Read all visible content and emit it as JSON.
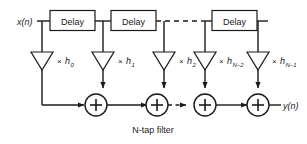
{
  "figure": {
    "caption": "N-tap filter",
    "background_color": "#ffffff",
    "line_color": "#1a1a1a"
  },
  "signals": {
    "input_label": "x(n)",
    "output_label": "y(n)"
  },
  "delays": [
    {
      "label": "Delay"
    },
    {
      "label": "Delay"
    },
    {
      "label": "Delay"
    }
  ],
  "taps": [
    {
      "multiplier_symbol": "×",
      "coefficient": "h",
      "subscript": "0"
    },
    {
      "multiplier_symbol": "×",
      "coefficient": "h",
      "subscript": "1"
    },
    {
      "multiplier_symbol": "×",
      "coefficient": "h",
      "subscript": "2"
    },
    {
      "multiplier_symbol": "×",
      "coefficient": "h",
      "subscript": "N−2"
    },
    {
      "multiplier_symbol": "×",
      "coefficient": "h",
      "subscript": "N−1"
    }
  ],
  "adders": [
    {
      "symbol": "+"
    },
    {
      "symbol": "+"
    },
    {
      "symbol": "+"
    },
    {
      "symbol": "+"
    }
  ],
  "continuation": {
    "top_row_style": "dashed",
    "adder_row_style": "dashed-arrow"
  }
}
